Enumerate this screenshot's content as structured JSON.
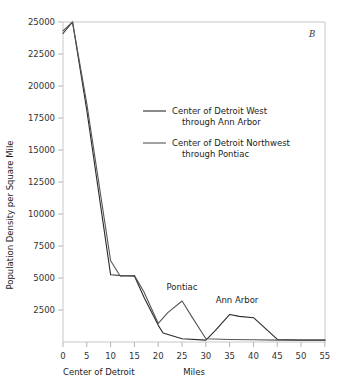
{
  "panel": {
    "label": "B"
  },
  "chart_data": {
    "type": "line",
    "title": "",
    "xlabel": "Miles",
    "ylabel": "Population Density per Square Mile",
    "origin_note": "Center of Detroit",
    "xlim": [
      0,
      55
    ],
    "ylim": [
      0,
      25000
    ],
    "grid": false,
    "legend_position": "upper-center",
    "xticks": [
      0,
      5,
      10,
      15,
      20,
      25,
      30,
      35,
      40,
      45,
      50,
      55
    ],
    "xtick_labels": [
      "0",
      "5",
      "10",
      "15",
      "20",
      "25",
      "30",
      "35",
      "40",
      "45",
      "50",
      "55"
    ],
    "yticks": [
      2500,
      5000,
      7500,
      10000,
      12500,
      15000,
      17500,
      20000,
      22500,
      25000
    ],
    "ytick_labels": [
      "2500",
      "5000",
      "7500",
      "10000",
      "12500",
      "15000",
      "17500",
      "20000",
      "22500",
      "25000"
    ],
    "series": [
      {
        "name": "Center of Detroit West through Ann Arbor",
        "color": "#2b2b2b",
        "x": [
          0,
          2,
          5,
          10,
          12,
          15,
          17,
          20,
          21,
          25,
          30,
          32,
          35,
          37,
          40,
          45,
          50,
          55
        ],
        "values": [
          24100,
          25000,
          18100,
          5250,
          5200,
          5150,
          3500,
          1300,
          700,
          250,
          150,
          900,
          2150,
          2000,
          1900,
          200,
          150,
          150
        ]
      },
      {
        "name": "Center of Detroit Northwest through Pontiac",
        "color": "#555555",
        "x": [
          0,
          2,
          5,
          10,
          12,
          15,
          17,
          20,
          22,
          25,
          27,
          30,
          35,
          40,
          45,
          50,
          55
        ],
        "values": [
          24300,
          25000,
          18600,
          6350,
          5150,
          5200,
          3900,
          1450,
          2300,
          3200,
          2000,
          250,
          200,
          180,
          150,
          150,
          150
        ]
      }
    ],
    "annotations": [
      {
        "text": "Pontiac",
        "x": 25,
        "y": 4500
      },
      {
        "text": "Ann Arbor",
        "x": 37,
        "y": 3500
      }
    ]
  },
  "legend": {
    "entries": [
      {
        "line1": "Center of Detroit West",
        "line2": "through Ann Arbor"
      },
      {
        "line1": "Center of Detroit Northwest",
        "line2": "through Pontiac"
      }
    ]
  }
}
